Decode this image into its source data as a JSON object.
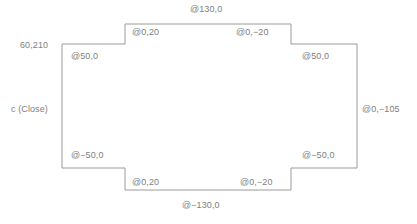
{
  "diagram": {
    "shape_name": "stepped-rectangle-outline",
    "stroke_color": "#9a9a9a",
    "text_color": "#808080",
    "background_color": "#ffffff",
    "labels": {
      "start_point": "60,210",
      "close": "c (Close)",
      "top": "@130,0",
      "top_left_riser": "@0,20",
      "top_right_riser": "@0,−20",
      "left_upper": "@50,0",
      "right_upper": "@50,0",
      "right_middle": "@0,−105",
      "left_lower": "@−50,0",
      "right_lower": "@−50,0",
      "bottom_left_riser": "@0,20",
      "bottom_right_riser": "@0,−20",
      "bottom": "@−130,0"
    }
  },
  "chart_data": {
    "type": "line",
    "xlabel": "",
    "ylabel": "",
    "polygon_points": [
      [
        62,
        44
      ],
      [
        125,
        44
      ],
      [
        125,
        24
      ],
      [
        291,
        24
      ],
      [
        291,
        44
      ],
      [
        357,
        44
      ],
      [
        357,
        168
      ],
      [
        291,
        168
      ],
      [
        291,
        190
      ],
      [
        125,
        190
      ],
      [
        125,
        168
      ],
      [
        62,
        168
      ]
    ],
    "closed": true,
    "annotations": [
      {
        "text": "60,210",
        "x": 20,
        "y": 40
      },
      {
        "text": "c (Close)",
        "x": 11,
        "y": 104
      },
      {
        "text": "@130,0",
        "x": 190,
        "y": 4
      },
      {
        "text": "@0,20",
        "x": 132,
        "y": 27
      },
      {
        "text": "@0,−20",
        "x": 236,
        "y": 27
      },
      {
        "text": "@50,0",
        "x": 71,
        "y": 51
      },
      {
        "text": "@50,0",
        "x": 302,
        "y": 51
      },
      {
        "text": "@0,−105",
        "x": 362,
        "y": 104
      },
      {
        "text": "@−50,0",
        "x": 71,
        "y": 150
      },
      {
        "text": "@−50,0",
        "x": 302,
        "y": 150
      },
      {
        "text": "@0,20",
        "x": 132,
        "y": 177
      },
      {
        "text": "@0,−20",
        "x": 240,
        "y": 177
      },
      {
        "text": "@−130,0",
        "x": 182,
        "y": 200
      }
    ]
  }
}
